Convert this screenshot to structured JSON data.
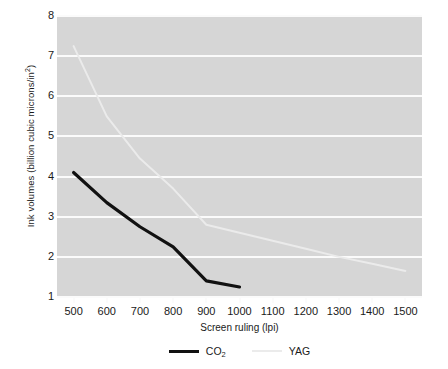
{
  "chart_data": {
    "type": "line",
    "title": "",
    "xlabel": "Screen ruling (lpi)",
    "ylabel": "Ink volumes (billion cubic microns/in²)",
    "ylabel_main": "Ink volumes (billion cubic microns/in",
    "ylabel_sup": "2",
    "ylabel_tail": ")",
    "xlim": [
      450,
      1550
    ],
    "ylim": [
      1,
      8
    ],
    "grid": true,
    "gridlines_y": [
      1,
      2,
      3,
      4,
      5,
      6,
      7,
      8
    ],
    "legend_position": "bottom-center",
    "x_ticks": [
      500,
      600,
      700,
      800,
      900,
      1000,
      1100,
      1200,
      1300,
      1400,
      1500
    ],
    "x_tick_labels": [
      "500",
      "600",
      "700",
      "800",
      "900",
      "1000",
      "1100",
      "1200",
      "1300",
      "1400",
      "1500"
    ],
    "y_ticks": [
      1,
      2,
      3,
      4,
      5,
      6,
      7,
      8
    ],
    "y_tick_labels": [
      "1",
      "2",
      "3",
      "4",
      "5",
      "6",
      "7",
      "8"
    ],
    "series": [
      {
        "name": "CO2",
        "legend_main": "CO",
        "legend_sub": "2",
        "color": "#111111",
        "width": 3.2,
        "x": [
          500,
          600,
          700,
          800,
          900,
          1000
        ],
        "values": [
          4.1,
          3.35,
          2.75,
          2.25,
          1.4,
          1.25
        ]
      },
      {
        "name": "YAG",
        "legend_main": "YAG",
        "legend_sub": "",
        "color": "#ebebeb",
        "width": 2.0,
        "x": [
          500,
          600,
          700,
          800,
          900,
          1000,
          1100,
          1200,
          1300,
          1400,
          1500
        ],
        "values": [
          7.25,
          5.5,
          4.45,
          3.7,
          2.8,
          2.6,
          2.4,
          2.2,
          2.0,
          1.83,
          1.65
        ]
      }
    ]
  },
  "colors": {
    "panel_background": "#d6d6d6",
    "gridline": "#fbfbfb",
    "page_background": "#ffffff",
    "text": "#1a1a1a",
    "co2": "#111111",
    "yag": "#ebebeb"
  }
}
